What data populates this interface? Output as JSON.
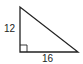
{
  "diagram": {
    "type": "right-triangle",
    "vertical_leg_label": "12",
    "horizontal_leg_label": "16",
    "right_angle_marker": true,
    "stroke_color": "#222222"
  }
}
